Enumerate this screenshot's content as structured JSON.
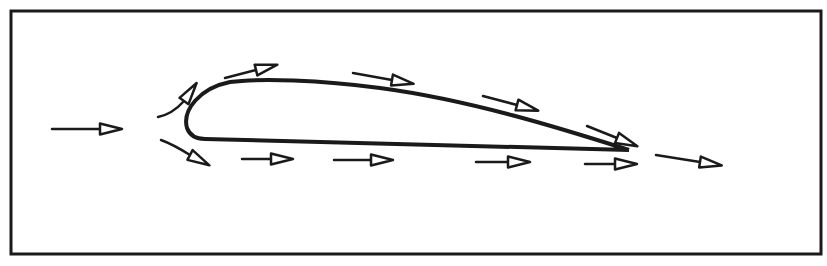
{
  "diagram": {
    "title": "",
    "colors": {
      "stroke": "#1a1a1a",
      "background": "#ffffff",
      "arrow_fill": "#ffffff"
    },
    "frame": {
      "x": 11,
      "y": 11,
      "width": 810,
      "height": 243
    },
    "airfoil": {
      "path": "M 629 150 C 560 128, 470 100, 380 88 C 320 80, 260 78, 230 82 C 200 88, 182 110, 187 128 C 190 136, 196 139, 205 139 L 629 150"
    },
    "arrows": [
      {
        "name": "freestream-arrow",
        "path": "M 52 129 L 100 129",
        "head": [
          100,
          129
        ],
        "angle": 0
      },
      {
        "name": "upper-leading-arrow",
        "path": "M 158 117 C 168 115, 176 110, 184 101",
        "head": [
          184,
          101
        ],
        "angle": -55
      },
      {
        "name": "lower-leading-arrow",
        "path": "M 161 140 C 172 144, 182 150, 190 155",
        "head": [
          190,
          155
        ],
        "angle": 28
      },
      {
        "name": "upper-arrow-1",
        "path": "M 225 78 L 256 70",
        "head": [
          256,
          70
        ],
        "angle": -14
      },
      {
        "name": "upper-arrow-2",
        "path": "M 353 73 L 392 80",
        "head": [
          392,
          80
        ],
        "angle": 10
      },
      {
        "name": "upper-arrow-3",
        "path": "M 483 96 L 517 105",
        "head": [
          517,
          105
        ],
        "angle": 15
      },
      {
        "name": "upper-arrow-4",
        "path": "M 587 126 L 617 138",
        "head": [
          617,
          138
        ],
        "angle": 22
      },
      {
        "name": "lower-arrow-1",
        "path": "M 242 159 L 271 159",
        "head": [
          271,
          159
        ],
        "angle": 0
      },
      {
        "name": "lower-arrow-2",
        "path": "M 334 160 L 371 160",
        "head": [
          371,
          160
        ],
        "angle": 0
      },
      {
        "name": "lower-arrow-3",
        "path": "M 476 162 L 508 162",
        "head": [
          508,
          162
        ],
        "angle": 0
      },
      {
        "name": "lower-arrow-4",
        "path": "M 585 164 L 615 164",
        "head": [
          615,
          164
        ],
        "angle": 0
      },
      {
        "name": "wake-arrow",
        "path": "M 656 155 L 700 162",
        "head": [
          700,
          162
        ],
        "angle": 9
      }
    ]
  }
}
